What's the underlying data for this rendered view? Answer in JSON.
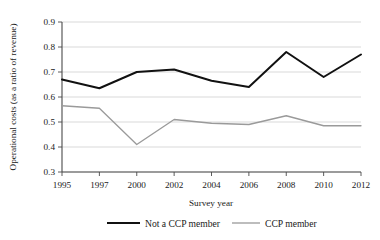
{
  "chart_data": {
    "type": "line",
    "title": "",
    "xlabel": "Survey year",
    "ylabel": "Operational costs (as a ratio of revenue)",
    "x": [
      1995,
      1997,
      2000,
      2002,
      2004,
      2006,
      2008,
      2010,
      2012
    ],
    "xtick_labels": [
      "1995",
      "1997",
      "2000",
      "2002",
      "2004",
      "2006",
      "2008",
      "2010",
      "2012"
    ],
    "ytick_labels": [
      "0.3",
      "0.4",
      "0.5",
      "0.6",
      "0.7",
      "0.8",
      "0.9"
    ],
    "yticks": [
      0.3,
      0.4,
      0.5,
      0.6,
      0.7,
      0.8,
      0.9
    ],
    "ylim": [
      0.3,
      0.9
    ],
    "grid": "horizontal",
    "legend_position": "bottom",
    "series": [
      {
        "name": "Not a CCP member",
        "color": "#111111",
        "values": [
          0.67,
          0.635,
          0.7,
          0.71,
          0.665,
          0.64,
          0.78,
          0.68,
          0.77
        ]
      },
      {
        "name": "CCP member",
        "color": "#9a9a9a",
        "values": [
          0.565,
          0.555,
          0.41,
          0.51,
          0.495,
          0.49,
          0.525,
          0.485,
          0.485
        ]
      }
    ]
  },
  "legend": {
    "items": [
      {
        "label": "Not a CCP member"
      },
      {
        "label": "CCP member"
      }
    ]
  },
  "axes": {
    "x_title": "Survey year",
    "y_title": "Operational costs (as a ratio of revenue)"
  }
}
